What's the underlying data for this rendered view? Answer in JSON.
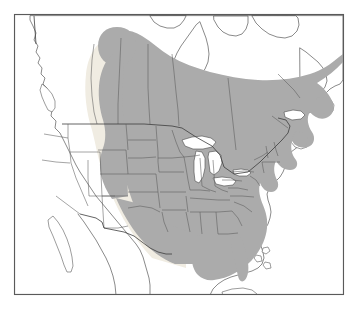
{
  "figure": {
    "kind": "range-distribution-map",
    "region": "North America",
    "title": "",
    "caption": "",
    "border_visible": true,
    "frame": {
      "x": 14,
      "y": 14,
      "width": 330,
      "height": 281
    }
  },
  "colors": {
    "background": "#ffffff",
    "range_fill": "#ababab",
    "range_fill_soft": "#f0ece2",
    "land_fill": "#ffffff",
    "coastline_stroke": "#4a4a4a",
    "subnational_stroke": "#5a5a5a",
    "national_stroke": "#3c3c3c",
    "lake_fill": "#ffffff",
    "frame_stroke": "#5a5a5a"
  },
  "legend": {
    "visible": false,
    "entries": [
      {
        "label": "Range",
        "swatch": "#ababab"
      }
    ]
  },
  "map_layers": [
    {
      "name": "coastline",
      "label": "Coastline",
      "visible": true
    },
    {
      "name": "national-borders",
      "label": "National borders",
      "visible": true
    },
    {
      "name": "subnational-borders",
      "label": "State / province borders",
      "visible": true
    },
    {
      "name": "range-shading",
      "label": "Species range shading",
      "visible": true
    },
    {
      "name": "great-lakes",
      "label": "Great Lakes",
      "visible": true
    }
  ],
  "range_description": {
    "shaded_area_label": "Shaded distribution range",
    "northern_limit": "Northern Alberta and central Quebec / Labrador",
    "western_limit": "Eastern foothills of the Rocky Mountains",
    "southern_limit": "Gulf Coast, central Texas and southern Florida",
    "eastern_limit": "Atlantic coast, Newfoundland and Nova Scotia",
    "included_regions": [
      "Alberta",
      "Saskatchewan",
      "Manitoba",
      "Ontario",
      "Quebec",
      "New Brunswick",
      "Nova Scotia",
      "Newfoundland",
      "Montana",
      "North Dakota",
      "South Dakota",
      "Nebraska",
      "Kansas",
      "Oklahoma",
      "Texas (eastern)",
      "Minnesota",
      "Iowa",
      "Missouri",
      "Arkansas",
      "Louisiana",
      "Wisconsin",
      "Illinois",
      "Michigan",
      "Indiana",
      "Ohio",
      "Kentucky",
      "Tennessee",
      "Mississippi",
      "Alabama",
      "Georgia",
      "Florida",
      "South Carolina",
      "North Carolina",
      "Virginia",
      "West Virginia",
      "Maryland",
      "Delaware",
      "Pennsylvania",
      "New Jersey",
      "New York",
      "Connecticut",
      "Rhode Island",
      "Massachusetts",
      "Vermont",
      "New Hampshire",
      "Maine",
      "Wyoming (eastern)",
      "Colorado (eastern)",
      "New Mexico (eastern)"
    ],
    "excluded_regions": [
      "Alaska",
      "Yukon",
      "Northwest Territories",
      "Nunavut",
      "Northern British Columbia",
      "Washington",
      "Oregon",
      "California",
      "Nevada",
      "Idaho",
      "Utah",
      "Arizona",
      "Western New Mexico",
      "Baja California",
      "Mexico",
      "Cuba",
      "Bahamas"
    ]
  }
}
